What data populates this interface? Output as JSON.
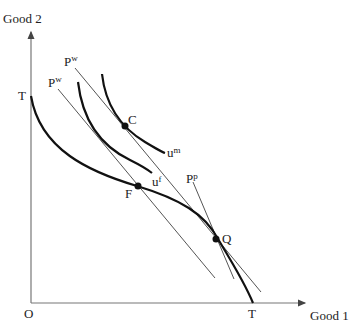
{
  "diagram": {
    "axes": {
      "y_label": "Good 2",
      "x_label": "Good 1",
      "origin_label": "O"
    },
    "ppf": {
      "y_intercept_label": "T",
      "x_intercept_label": "T"
    },
    "points": {
      "consumption": "C",
      "free_trade_production": "F",
      "protected_production": "Q"
    },
    "price_lines": {
      "world_upper": {
        "base": "P",
        "sup": "w"
      },
      "world_lower": {
        "base": "P",
        "sup": "w"
      },
      "protected": {
        "base": "P",
        "sup": "p"
      }
    },
    "indifference_curves": {
      "higher": {
        "base": "u",
        "sup": "m"
      },
      "lower": {
        "base": "u",
        "sup": "f"
      }
    },
    "colors": {
      "curve": "#111111",
      "line": "#555555",
      "axis": "#777777"
    }
  }
}
